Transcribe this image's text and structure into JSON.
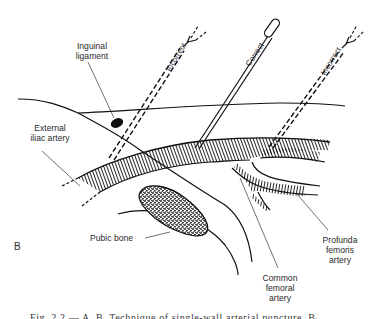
{
  "figure": {
    "panel_label": "B",
    "labels": {
      "inguinal_ligament": "Inguinal\nligament",
      "external_iliac_artery": "External\niliac artery",
      "pubic_bone": "Pubic bone",
      "common_femoral_artery": "Common\nfemoral\nartery",
      "profunda_femoris_artery": "Profunda\nfemoris\nartery"
    },
    "needles": {
      "left": {
        "label": "Incorrect",
        "style": "dashed"
      },
      "center": {
        "label": "Correct",
        "style": "solid"
      },
      "right": {
        "label": "Incorrect",
        "style": "dashed"
      }
    },
    "caption": "Fig. 2.2 — A, B, Technique of single-wall arterial puncture. B..."
  },
  "colors": {
    "ink": "#111111",
    "label_text": "#2a2a2a",
    "background": "#ffffff"
  }
}
